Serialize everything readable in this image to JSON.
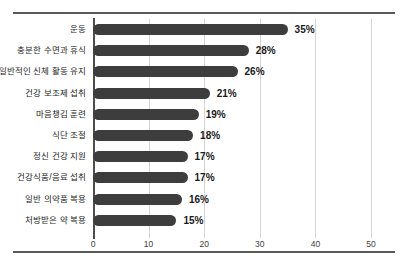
{
  "chart_data": {
    "type": "bar",
    "orientation": "horizontal",
    "title": "",
    "xlabel": "",
    "ylabel": "",
    "xlim": [
      0,
      50
    ],
    "grid": true,
    "legend": false,
    "value_suffix": "%",
    "xticks": [
      0,
      10,
      20,
      30,
      40,
      50
    ],
    "xtick_labels": [
      "0",
      "10",
      "20",
      "30",
      "40",
      "50"
    ],
    "categories": [
      "운동",
      "충분한 수면과 휴식",
      "일반적인 신체 활동 유지",
      "건강 보조제 섭취",
      "마음챙김 훈련",
      "식단 조절",
      "정신 건강 지원",
      "건강식품/음료 섭취",
      "일반 의약품 복용",
      "처방받은 약 복용"
    ],
    "values": [
      35,
      28,
      26,
      21,
      19,
      18,
      17,
      17,
      16,
      15
    ],
    "value_labels": [
      "35%",
      "28%",
      "26%",
      "21%",
      "19%",
      "18%",
      "17%",
      "17%",
      "16%",
      "15%"
    ],
    "bar_color": "#3d3d3d",
    "grid_color": "#d4d4d4",
    "axis_color": "#4d4d4d"
  },
  "caption": ""
}
